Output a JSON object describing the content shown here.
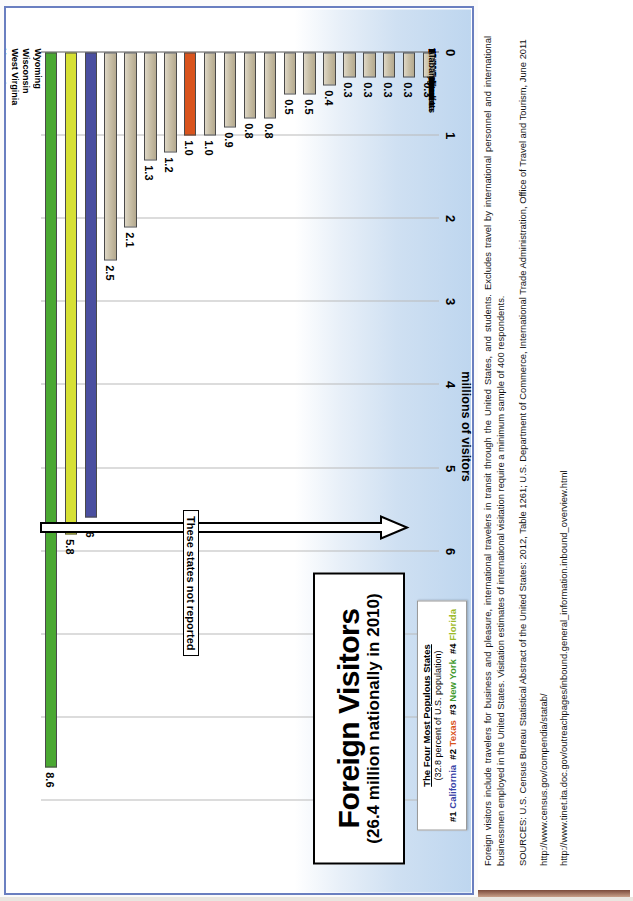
{
  "title": {
    "main": "Foreign Visitors",
    "sub": "(26.4 million nationally in 2010)"
  },
  "legend": {
    "heading": "The Four Most Populous States",
    "subheading": "(32.8 percent of U.S. population)",
    "entries": [
      {
        "rank": "#1",
        "state": "California",
        "color": "#3a46a8"
      },
      {
        "rank": "#2",
        "state": "Texas",
        "color": "#d9541e"
      },
      {
        "rank": "#3",
        "state": "New York",
        "color": "#3f9a2e"
      },
      {
        "rank": "#4",
        "state": "Florida",
        "color": "#9dbb2b"
      }
    ]
  },
  "annotation": {
    "not_reported_label": "These states not reported"
  },
  "notes": {
    "paragraph": "Foreign visitors include travelers for business and pleasure, international travelers in transit through the United States, and students.  Excludes travel by international personnel and international businessmen employed in the United States. Visitation estimates of international visitation require a minimum sample of 400 respondents.",
    "sources": "SOURCES: U.S. Census Bureau Statistical Abstract of the United States: 2012, Table 1261; U.S. Department of Commerce, International Trade Administration, Office of Travel and Tourism, June 2011",
    "url1": "http://www.census.gov/compendia/statab/",
    "url2": "http://www.tinet.ita.doc.gov/outreachpages/inbound.general_information.inbound_overview.html"
  },
  "chart_data": {
    "type": "bar",
    "title": "Foreign Visitors (26.4 million nationally in 2010)",
    "xlabel": "",
    "ylabel": "millions of visitors",
    "ylim": [
      0,
      9
    ],
    "yticks": [
      0,
      1,
      2,
      3,
      4,
      5,
      6,
      7,
      8,
      9
    ],
    "grid": true,
    "orientation": "horizontal",
    "legend_position": "top-left",
    "categories": [
      "New York",
      "Florida",
      "California",
      "Nevada",
      "Hawaii",
      "Massachusetts",
      "Illinois",
      "Texas",
      "New Jersey",
      "Pennsylvania",
      "Georgia",
      "Arizona",
      "Washington",
      "Utah",
      "Virginia",
      "Colorado",
      "North Carolina",
      "Ohio",
      "Connecticut",
      "Alabama"
    ],
    "values": [
      8.6,
      5.8,
      5.6,
      2.5,
      2.1,
      1.3,
      1.2,
      1.0,
      1.0,
      0.9,
      0.8,
      0.8,
      0.5,
      0.5,
      0.4,
      0.3,
      0.3,
      0.3,
      0.3,
      0.3
    ],
    "bar_colors": [
      "#4aa832",
      "#d6e034",
      "#4a4fa0",
      "#c9c0a8",
      "#c9c0a8",
      "#c9c0a8",
      "#c9c0a8",
      "#d9541e",
      "#c9c0a8",
      "#c9c0a8",
      "#c9c0a8",
      "#c9c0a8",
      "#c9c0a8",
      "#c9c0a8",
      "#c9c0a8",
      "#c9c0a8",
      "#c9c0a8",
      "#c9c0a8",
      "#c9c0a8",
      "#c9c0a8"
    ],
    "not_reported": [
      "Alaska",
      "Arkansas",
      "Delaware",
      "Idaho",
      "Indiana",
      "Iowa",
      "Kansas",
      "Kentucky",
      "Louisiana",
      "Maine",
      "Maryland",
      "Michigan",
      "Minnesota",
      "Mississippi",
      "Missouri",
      "Montana",
      "Nebraska",
      "New Hampshire",
      "New Mexico",
      "North Dakota",
      "Oklahoma",
      "Oregon",
      "Rhode Island",
      "South Carolina",
      "South Dakota",
      "Tennessee",
      "Vermont",
      "West Virginia",
      "Wisconsin",
      "Wyoming"
    ]
  }
}
